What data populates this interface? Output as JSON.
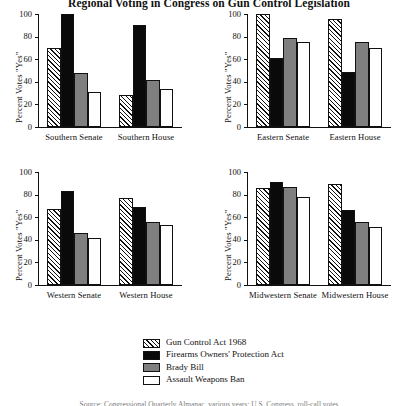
{
  "title": "Regional Voting in Congress on Gun Control Legislation",
  "footnote": "Source: Congressional Quarterly Almanac, various years; U.S. Congress, roll-call votes",
  "axis": {
    "ylabel": "Percent Votes \"Yes\"",
    "yticks": [
      "0",
      "20",
      "40",
      "60",
      "80",
      "100"
    ],
    "ymin": 0,
    "ymax": 100
  },
  "legend": {
    "items": [
      {
        "label": "Gun Control Act 1968",
        "pattern": "hatched",
        "color": "#ffffff"
      },
      {
        "label": "Firearms Owners' Protection Act",
        "pattern": "solid",
        "color": "#0a0a0a"
      },
      {
        "label": "Brady Bill",
        "pattern": "solid",
        "color": "#7f7f7f"
      },
      {
        "label": "Assault Weapons Ban",
        "pattern": "open",
        "color": "#ffffff"
      }
    ]
  },
  "chart_data": {
    "type": "bar",
    "title": "Regional Voting in Congress on Gun Control Legislation",
    "xlabel": "",
    "ylabel": "Percent Votes \"Yes\"",
    "ylim": [
      0,
      100
    ],
    "yticks": [
      0,
      20,
      40,
      60,
      80,
      100
    ],
    "grid": false,
    "legend_position": "bottom-center",
    "series_names": [
      "Gun Control Act 1968",
      "Firearms Owners' Protection Act",
      "Brady Bill",
      "Assault Weapons Ban"
    ],
    "panels": [
      {
        "id": "southern",
        "position": "top-left",
        "categories": [
          "Southern Senate",
          "Southern House"
        ],
        "series": [
          {
            "name": "Gun Control Act 1968",
            "values": [
              70,
              28
            ]
          },
          {
            "name": "Firearms Owners' Protection Act",
            "values": [
              100,
              90
            ]
          },
          {
            "name": "Brady Bill",
            "values": [
              48,
              42
            ]
          },
          {
            "name": "Assault Weapons Ban",
            "values": [
              31,
              34
            ]
          }
        ]
      },
      {
        "id": "eastern",
        "position": "top-right",
        "categories": [
          "Eastern Senate",
          "Eastern House"
        ],
        "series": [
          {
            "name": "Gun Control Act 1968",
            "values": [
              100,
              96
            ]
          },
          {
            "name": "Firearms Owners' Protection Act",
            "values": [
              61,
              49
            ]
          },
          {
            "name": "Brady Bill",
            "values": [
              79,
              75
            ]
          },
          {
            "name": "Assault Weapons Ban",
            "values": [
              75,
              70
            ]
          }
        ]
      },
      {
        "id": "western",
        "position": "bottom-left",
        "categories": [
          "Western Senate",
          "Western House"
        ],
        "series": [
          {
            "name": "Gun Control Act 1968",
            "values": [
              67,
              77
            ]
          },
          {
            "name": "Firearms Owners' Protection Act",
            "values": [
              83,
              69
            ]
          },
          {
            "name": "Brady Bill",
            "values": [
              46,
              56
            ]
          },
          {
            "name": "Assault Weapons Ban",
            "values": [
              42,
              53
            ]
          }
        ]
      },
      {
        "id": "midwestern",
        "position": "bottom-right",
        "categories": [
          "Midwestern Senate",
          "Midwestern House"
        ],
        "series": [
          {
            "name": "Gun Control Act 1968",
            "values": [
              86,
              89
            ]
          },
          {
            "name": "Firearms Owners' Protection Act",
            "values": [
              91,
              66
            ]
          },
          {
            "name": "Brady Bill",
            "values": [
              87,
              56
            ]
          },
          {
            "name": "Assault Weapons Ban",
            "values": [
              78,
              51
            ]
          }
        ]
      }
    ]
  }
}
